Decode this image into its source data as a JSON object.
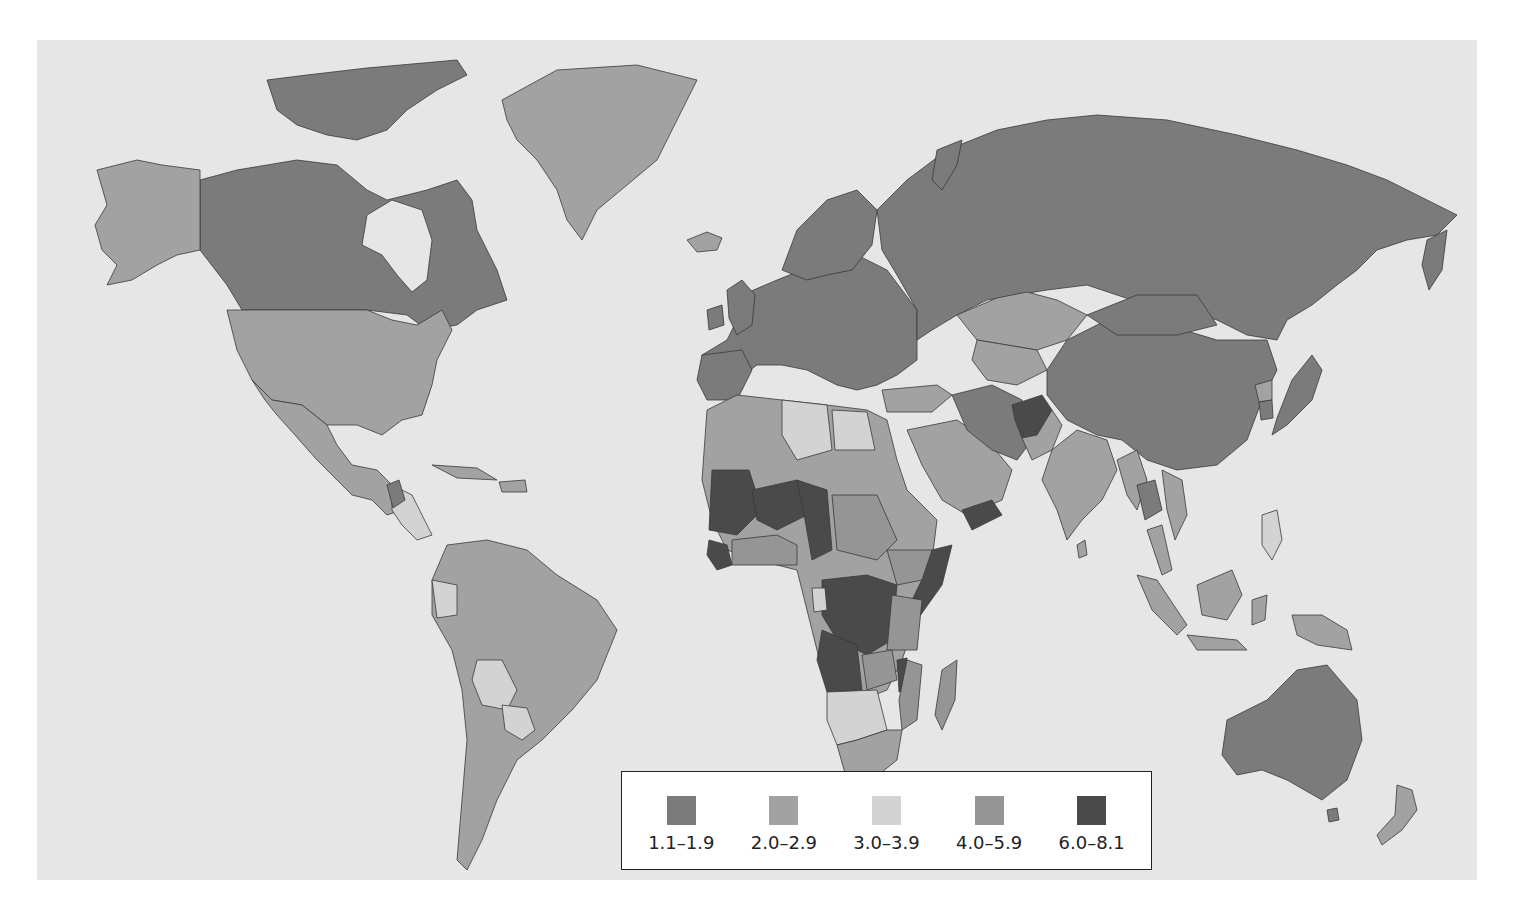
{
  "map": {
    "type": "choropleth world map",
    "background_color": "#e6e6e6"
  },
  "legend": {
    "items": [
      {
        "label": "1.1–1.9",
        "color": "#7b7b7b"
      },
      {
        "label": "2.0–2.9",
        "color": "#a2a2a2"
      },
      {
        "label": "3.0–3.9",
        "color": "#d3d3d3"
      },
      {
        "label": "4.0–5.9",
        "color": "#959595"
      },
      {
        "label": "6.0–8.1",
        "color": "#4a4a4a"
      }
    ]
  },
  "regions": {
    "canada": "1.1–1.9",
    "alaska_usa": "2.0–2.9",
    "greenland": "2.0–2.9",
    "russia": "1.1–1.9",
    "europe": "1.1–1.9",
    "china": "1.1–1.9",
    "australia": "1.1–1.9",
    "south_america": "2.0–2.9",
    "bolivia_paraguay": "3.0–3.9",
    "north_africa_libya_egypt": "3.0–3.9",
    "sahel_mali_niger_chad": "6.0–8.1",
    "dr_congo_angola": "6.0–8.1",
    "somalia_yemen": "6.0–8.1",
    "afghanistan": "6.0–8.1",
    "india": "2.0–2.9",
    "kazakhstan": "2.0–2.9",
    "southern_africa": "3.0–3.9",
    "east_africa": "4.0–5.9"
  }
}
